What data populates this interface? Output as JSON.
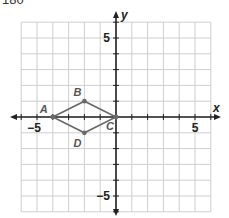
{
  "header": {
    "text": "180"
  },
  "chart_data": {
    "type": "scatter",
    "title": "",
    "xlabel": "x",
    "ylabel": "y",
    "xlim": [
      -6,
      6
    ],
    "ylim": [
      -6,
      6
    ],
    "grid": true,
    "x_tick_labels": [
      {
        "value": -5,
        "label": "−5"
      },
      {
        "value": 5,
        "label": "5"
      }
    ],
    "y_tick_labels": [
      {
        "value": 5,
        "label": "5"
      },
      {
        "value": -5,
        "label": "−5"
      }
    ],
    "points": [
      {
        "name": "A",
        "x": -4,
        "y": 0
      },
      {
        "name": "B",
        "x": -2,
        "y": 1
      },
      {
        "name": "C",
        "x": 0,
        "y": 0
      },
      {
        "name": "D",
        "x": -2,
        "y": -1
      }
    ],
    "polygon": [
      "A",
      "B",
      "C",
      "D"
    ],
    "colors": {
      "grid": "#cfcfcf",
      "axis": "#222222",
      "shape": "#6a6a6a"
    }
  }
}
